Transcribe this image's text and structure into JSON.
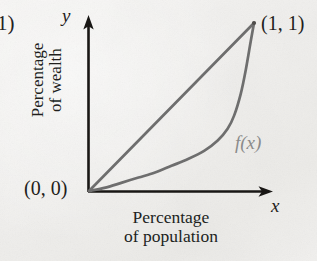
{
  "figure": {
    "type": "lorenz-curve-diagram",
    "background_color": "#f2f1ef",
    "axis_color": "#1a1a1a",
    "curve_color": "#6e6e6e"
  },
  "labels": {
    "cut_left_fragment": "1)",
    "point_top_right": "(1, 1)",
    "point_origin": "(0, 0)",
    "axis_x_symbol": "x",
    "axis_y_symbol": "y",
    "curve_name": "f(x)"
  },
  "axis_titles": {
    "y_line1": "Percentage",
    "y_line2": "of wealth",
    "x_line1": "Percentage",
    "x_line2": "of population"
  },
  "chart_data": {
    "type": "line",
    "title": "",
    "xlabel": "Percentage of population",
    "ylabel": "Percentage of wealth",
    "xlim": [
      0,
      1
    ],
    "ylim": [
      0,
      1
    ],
    "grid": false,
    "legend": "inline-annotation",
    "annotations": [
      {
        "text": "(0, 0)",
        "x": 0,
        "y": 0
      },
      {
        "text": "(1, 1)",
        "x": 1,
        "y": 1
      },
      {
        "text": "f(x)",
        "x": 0.92,
        "y": 0.33
      }
    ],
    "series": [
      {
        "name": "line of equality",
        "color": "#6e6e6e",
        "x": [
          0,
          1
        ],
        "y": [
          0,
          1
        ]
      },
      {
        "name": "f(x)",
        "color": "#6e6e6e",
        "x": [
          0.0,
          0.1,
          0.2,
          0.3,
          0.4,
          0.5,
          0.6,
          0.7,
          0.78,
          0.84,
          0.88,
          0.92,
          0.95,
          0.98,
          1.0
        ],
        "y": [
          0.0,
          0.02,
          0.05,
          0.08,
          0.11,
          0.15,
          0.19,
          0.24,
          0.3,
          0.37,
          0.45,
          0.58,
          0.72,
          0.89,
          1.0
        ]
      }
    ]
  }
}
